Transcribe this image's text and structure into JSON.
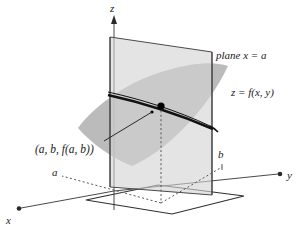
{
  "figure": {
    "type": "math-diagram-3d",
    "background_color": "#ffffff",
    "axes": {
      "z_label": "z",
      "y_label": "y",
      "x_label": "x"
    },
    "labels": {
      "plane_label": "plane x = a",
      "surface_label": "z = f(x, y)",
      "point_label": "(a, b, f(a, b))",
      "a_label": "a",
      "b_label": "b"
    },
    "colors": {
      "vertical_plane_fill": "#d6d6d6",
      "surface_fill": "#a8a8a8",
      "outline": "#4a4a4a",
      "curve": "#111111",
      "point": "#000000",
      "text": "#1a1a1a",
      "dotted_guide": "#555555"
    }
  }
}
